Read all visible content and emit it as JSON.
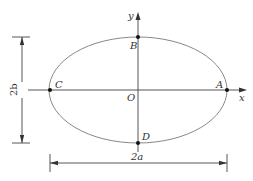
{
  "diagram": {
    "axes": {
      "x_label": "x",
      "y_label": "y",
      "origin_label": "O"
    },
    "points": [
      {
        "id": "A",
        "label": "A",
        "position": "right vertex on x-axis"
      },
      {
        "id": "B",
        "label": "B",
        "position": "top vertex on y-axis"
      },
      {
        "id": "C",
        "label": "C",
        "position": "left vertex on x-axis"
      },
      {
        "id": "D",
        "label": "D",
        "position": "bottom vertex on y-axis"
      }
    ],
    "dimensions": {
      "horizontal": "2a",
      "vertical": "2b"
    },
    "colors": {
      "ellipse": "#888888",
      "lines": "#444444",
      "points": "#111111",
      "background": "#ffffff"
    }
  }
}
